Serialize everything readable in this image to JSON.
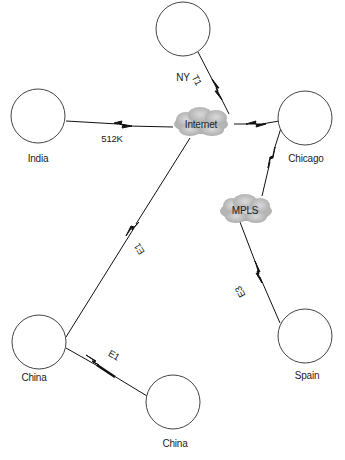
{
  "diagram": {
    "type": "network-topology",
    "nodes": [
      {
        "id": "ny",
        "label": "NY",
        "shape": "circle"
      },
      {
        "id": "india",
        "label": "India",
        "shape": "circle"
      },
      {
        "id": "chicago",
        "label": "Chicago",
        "shape": "circle"
      },
      {
        "id": "china1",
        "label": "China",
        "shape": "circle"
      },
      {
        "id": "china2",
        "label": "China",
        "shape": "circle"
      },
      {
        "id": "spain",
        "label": "Spain",
        "shape": "circle"
      }
    ],
    "clouds": [
      {
        "id": "internet",
        "label": "Internet"
      },
      {
        "id": "mpls",
        "label": "MPLS"
      }
    ],
    "links": [
      {
        "from": "ny",
        "to": "internet",
        "label": "T1"
      },
      {
        "from": "india",
        "to": "internet",
        "label": "512K"
      },
      {
        "from": "internet",
        "to": "chicago",
        "label": ""
      },
      {
        "from": "chicago",
        "to": "mpls",
        "label": ""
      },
      {
        "from": "mpls",
        "to": "spain",
        "label": "E3"
      },
      {
        "from": "internet",
        "to": "china1",
        "label": "E1"
      },
      {
        "from": "china1",
        "to": "china2",
        "label": "E1"
      }
    ],
    "colors": {
      "cloud_fill": "#bdbdbd",
      "line": "#111111",
      "circle_stroke": "#444444"
    }
  }
}
